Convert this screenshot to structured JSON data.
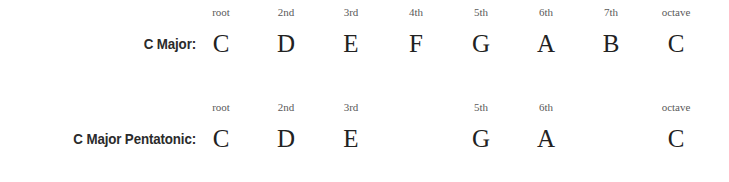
{
  "page": {
    "background_color": "#ffffff",
    "label_color": "#2b2b2b",
    "degree_color": "#5a5a5a",
    "note_color": "#222222"
  },
  "layout": {
    "first_column_x": 221,
    "column_spacing": 65,
    "label_right_edge": 196
  },
  "chart_data": {
    "type": "table",
    "title": "",
    "columns": [
      "root",
      "2nd",
      "3rd",
      "4th",
      "5th",
      "6th",
      "7th",
      "octave"
    ],
    "rows": [
      {
        "label": "C Major:",
        "degrees": [
          "root",
          "2nd",
          "3rd",
          "4th",
          "5th",
          "6th",
          "7th",
          "octave"
        ],
        "notes": [
          "C",
          "D",
          "E",
          "F",
          "G",
          "A",
          "B",
          "C"
        ]
      },
      {
        "label": "C Major Pentatonic:",
        "degrees": [
          "root",
          "2nd",
          "3rd",
          "",
          "5th",
          "6th",
          "",
          "octave"
        ],
        "notes": [
          "C",
          "D",
          "E",
          "",
          "G",
          "A",
          "",
          "C"
        ]
      }
    ]
  }
}
